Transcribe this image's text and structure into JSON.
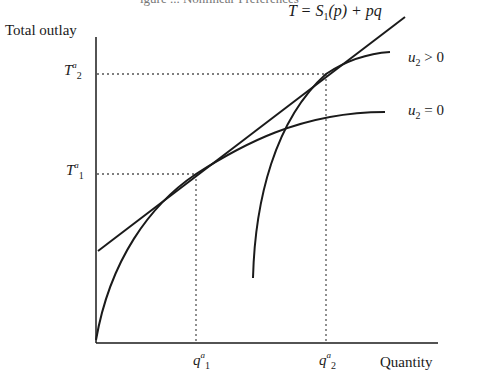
{
  "figure": {
    "caption_partial": "igure ... Nonlinear Preferences",
    "y_axis_label": "Total outlay",
    "x_axis_label": "Quantity",
    "tangent_label": {
      "prefix": "T = S",
      "sub": "1",
      "suffix": "(p) + pq"
    },
    "curve_labels": [
      {
        "var": "u",
        "sub": "2",
        "rel": " > 0"
      },
      {
        "var": "u",
        "sub": "2",
        "rel": " = 0"
      }
    ],
    "y_ticks": [
      {
        "var": "T",
        "sup": "a",
        "sub": "2"
      },
      {
        "var": "T",
        "sup": "a",
        "sub": "1"
      }
    ],
    "x_ticks": [
      {
        "var": "q",
        "sup": "a",
        "sub": "1"
      },
      {
        "var": "q",
        "sup": "a",
        "sub": "2"
      }
    ],
    "colors": {
      "ink": "#1a1a1a",
      "dotted": "#555555"
    }
  }
}
